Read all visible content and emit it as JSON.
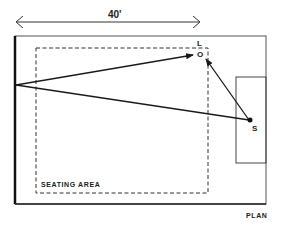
{
  "diagram": {
    "dimension_label": "40'",
    "label_L": "L",
    "label_O": "O",
    "label_S": "S",
    "seating_label": "SEATING AREA",
    "plan_label": "PLAN",
    "footer_fragment": "Fig"
  },
  "colors": {
    "ink": "#1a1a1a",
    "paper": "#ffffff"
  }
}
